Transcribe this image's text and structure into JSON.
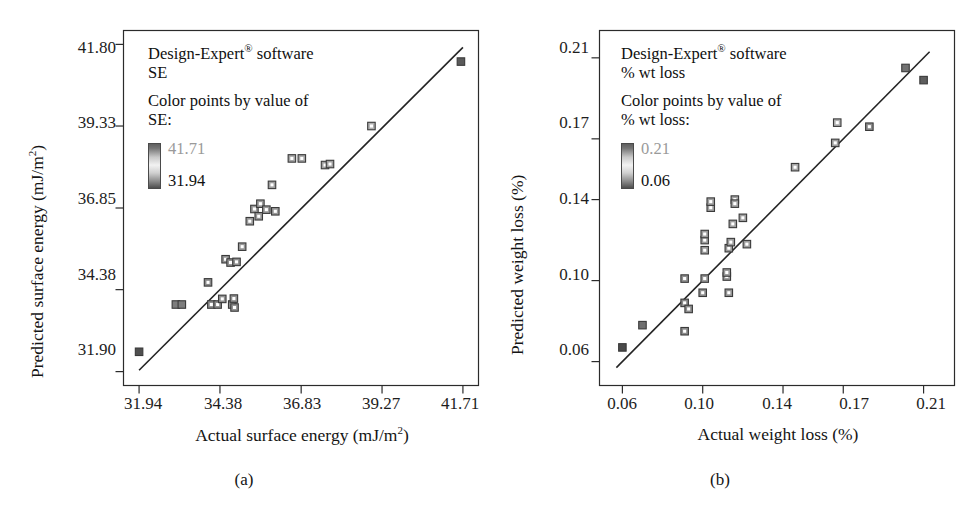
{
  "figure": {
    "width": 978,
    "height": 519,
    "background": "#ffffff",
    "ink_color": "#1a1a1a"
  },
  "panels": [
    {
      "id": "a",
      "caption": "(a)",
      "legend": {
        "software_line": "Design-Expert",
        "registered_mark": "®",
        "software_suffix": " software",
        "response_name": "SE",
        "color_by_line": "Color points by value of",
        "color_by_response": "SE:",
        "colorbar_high": "41.71",
        "colorbar_low": "31.94",
        "colorbar_high_color": "#9a9a9a",
        "colorbar_low_color": "#111111"
      },
      "chart_data": {
        "type": "scatter",
        "title": "",
        "xlabel": "Actual surface energy (mJ/m2)",
        "xlabel_base": "Actual surface energy (mJ/m",
        "xlabel_sup": "2",
        "xlabel_tail": ")",
        "ylabel": "Predicted surface energy (mJ/m2)",
        "ylabel_base": "Predicted surface energy (mJ/m",
        "ylabel_sup": "2",
        "ylabel_tail": ")",
        "xticks": [
          31.94,
          34.38,
          36.83,
          39.27,
          41.71
        ],
        "xtick_labels": [
          "31.94",
          "34.38",
          "36.83",
          "39.27",
          "41.71"
        ],
        "yticks": [
          31.9,
          34.38,
          36.85,
          39.33,
          41.8
        ],
        "ytick_labels": [
          "31.90",
          "34.38",
          "36.85",
          "39.33",
          "41.80"
        ],
        "xlim": [
          31.47,
          42.18
        ],
        "ylim": [
          31.48,
          42.22
        ],
        "grid": false,
        "legend_position": "inside-top-left",
        "reference_line": {
          "label": "y = x (predicted vs actual)",
          "x": [
            31.94,
            41.71
          ],
          "y": [
            31.94,
            41.71
          ]
        },
        "marker": "square-open",
        "points": [
          {
            "x": 31.94,
            "y": 32.5,
            "shade": "#4f4f4f"
          },
          {
            "x": 33.05,
            "y": 33.93,
            "shade": "#7d7d7d"
          },
          {
            "x": 33.23,
            "y": 33.93,
            "shade": "#7d7d7d"
          },
          {
            "x": 34.12,
            "y": 33.93,
            "shade": "#8d8d8d"
          },
          {
            "x": 34.31,
            "y": 33.93,
            "shade": "#8d8d8d"
          },
          {
            "x": 34.45,
            "y": 34.1,
            "shade": "#909090"
          },
          {
            "x": 34.75,
            "y": 33.93,
            "shade": "#8f8f8f"
          },
          {
            "x": 34.8,
            "y": 34.11,
            "shade": "#909090"
          },
          {
            "x": 34.82,
            "y": 33.84,
            "shade": "#909090"
          },
          {
            "x": 34.02,
            "y": 34.6,
            "shade": "#8a8a8a"
          },
          {
            "x": 34.55,
            "y": 35.3,
            "shade": "#919191"
          },
          {
            "x": 34.7,
            "y": 35.2,
            "shade": "#919191"
          },
          {
            "x": 34.88,
            "y": 35.22,
            "shade": "#8f8f8f"
          },
          {
            "x": 35.05,
            "y": 35.68,
            "shade": "#989898"
          },
          {
            "x": 35.28,
            "y": 36.45,
            "shade": "#9a9a9a"
          },
          {
            "x": 35.42,
            "y": 36.82,
            "shade": "#9a9a9a"
          },
          {
            "x": 35.55,
            "y": 36.6,
            "shade": "#979797"
          },
          {
            "x": 35.6,
            "y": 36.98,
            "shade": "#9c9c9c"
          },
          {
            "x": 35.78,
            "y": 36.8,
            "shade": "#9a9a9a"
          },
          {
            "x": 35.95,
            "y": 37.55,
            "shade": "#9f9f9f"
          },
          {
            "x": 36.05,
            "y": 36.75,
            "shade": "#9b9b9b"
          },
          {
            "x": 36.55,
            "y": 38.35,
            "shade": "#a5a5a5"
          },
          {
            "x": 36.85,
            "y": 38.35,
            "shade": "#a5a5a5"
          },
          {
            "x": 37.55,
            "y": 38.15,
            "shade": "#a0a0a0"
          },
          {
            "x": 37.7,
            "y": 38.18,
            "shade": "#a0a0a0"
          },
          {
            "x": 38.95,
            "y": 39.33,
            "shade": "#b0b0b0"
          },
          {
            "x": 41.65,
            "y": 41.28,
            "shade": "#5a5a5a"
          }
        ]
      }
    },
    {
      "id": "b",
      "caption": "(b)",
      "legend": {
        "software_line": "Design-Expert",
        "registered_mark": "®",
        "software_suffix": " software",
        "response_name": "% wt loss",
        "color_by_line": "Color points by value of",
        "color_by_response": "% wt loss:",
        "colorbar_high": "0.21",
        "colorbar_low": "0.06",
        "colorbar_high_color": "#9a9a9a",
        "colorbar_low_color": "#111111"
      },
      "chart_data": {
        "type": "scatter",
        "title": "",
        "xlabel": "Actual weight loss (%)",
        "ylabel": "Predicted weight loss (%)",
        "xticks": [
          0.06,
          0.1,
          0.14,
          0.17,
          0.21
        ],
        "xtick_labels": [
          "0.06",
          "0.10",
          "0.14",
          "0.17",
          "0.21"
        ],
        "yticks": [
          0.06,
          0.1,
          0.14,
          0.17,
          0.21
        ],
        "ytick_labels": [
          "0.06",
          "0.10",
          "0.14",
          "0.17",
          "0.21"
        ],
        "xlim": [
          0.0486,
          0.2254
        ],
        "ylim": [
          0.0482,
          0.2235
        ],
        "grid": false,
        "legend_position": "inside-top-left",
        "reference_line": {
          "label": "y = x (predicted vs actual)",
          "x": [
            0.057,
            0.213
          ],
          "y": [
            0.057,
            0.213
          ]
        },
        "marker": "square-open",
        "points": [
          {
            "x": 0.06,
            "y": 0.067,
            "shade": "#4a4a4a"
          },
          {
            "x": 0.07,
            "y": 0.078,
            "shade": "#6e6e6e"
          },
          {
            "x": 0.091,
            "y": 0.075,
            "shade": "#8b8b8b"
          },
          {
            "x": 0.091,
            "y": 0.089,
            "shade": "#8a8a8a"
          },
          {
            "x": 0.091,
            "y": 0.101,
            "shade": "#909090"
          },
          {
            "x": 0.093,
            "y": 0.086,
            "shade": "#8c8c8c"
          },
          {
            "x": 0.1,
            "y": 0.094,
            "shade": "#8f8f8f"
          },
          {
            "x": 0.101,
            "y": 0.101,
            "shade": "#959595"
          },
          {
            "x": 0.101,
            "y": 0.115,
            "shade": "#9a9a9a"
          },
          {
            "x": 0.101,
            "y": 0.12,
            "shade": "#9a9a9a"
          },
          {
            "x": 0.101,
            "y": 0.123,
            "shade": "#9b9b9b"
          },
          {
            "x": 0.104,
            "y": 0.136,
            "shade": "#a0a0a0"
          },
          {
            "x": 0.104,
            "y": 0.139,
            "shade": "#a0a0a0"
          },
          {
            "x": 0.112,
            "y": 0.102,
            "shade": "#9a9a9a"
          },
          {
            "x": 0.112,
            "y": 0.104,
            "shade": "#9a9a9a"
          },
          {
            "x": 0.113,
            "y": 0.094,
            "shade": "#949494"
          },
          {
            "x": 0.113,
            "y": 0.116,
            "shade": "#9c9c9c"
          },
          {
            "x": 0.114,
            "y": 0.119,
            "shade": "#9c9c9c"
          },
          {
            "x": 0.115,
            "y": 0.128,
            "shade": "#9e9e9e"
          },
          {
            "x": 0.116,
            "y": 0.14,
            "shade": "#a2a2a2"
          },
          {
            "x": 0.116,
            "y": 0.138,
            "shade": "#a0a0a0"
          },
          {
            "x": 0.12,
            "y": 0.131,
            "shade": "#9f9f9f"
          },
          {
            "x": 0.122,
            "y": 0.118,
            "shade": "#9d9d9d"
          },
          {
            "x": 0.146,
            "y": 0.156,
            "shade": "#a6a6a6"
          },
          {
            "x": 0.166,
            "y": 0.168,
            "shade": "#9f9f9f"
          },
          {
            "x": 0.167,
            "y": 0.178,
            "shade": "#b2b2b2"
          },
          {
            "x": 0.183,
            "y": 0.176,
            "shade": "#8d8d8d"
          },
          {
            "x": 0.201,
            "y": 0.205,
            "shade": "#727272"
          },
          {
            "x": 0.21,
            "y": 0.199,
            "shade": "#5e5e5e"
          }
        ]
      }
    }
  ]
}
